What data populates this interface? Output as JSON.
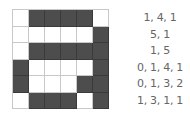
{
  "grid": {
    "rows": 6,
    "cols": 6,
    "cells": [
      [
        0,
        1,
        1,
        1,
        1,
        0
      ],
      [
        0,
        0,
        0,
        0,
        0,
        1
      ],
      [
        0,
        1,
        1,
        1,
        1,
        1
      ],
      [
        1,
        0,
        0,
        0,
        0,
        1
      ],
      [
        1,
        0,
        0,
        0,
        1,
        1
      ],
      [
        0,
        1,
        1,
        1,
        0,
        1
      ]
    ],
    "fill_color": "#4d4d4d",
    "empty_color": "#ffffff"
  },
  "encoding": [
    "1, 4, 1",
    "5, 1",
    "1, 5",
    "0, 1, 4, 1",
    "0, 1, 3, 2",
    "1, 3, 1, 1"
  ]
}
